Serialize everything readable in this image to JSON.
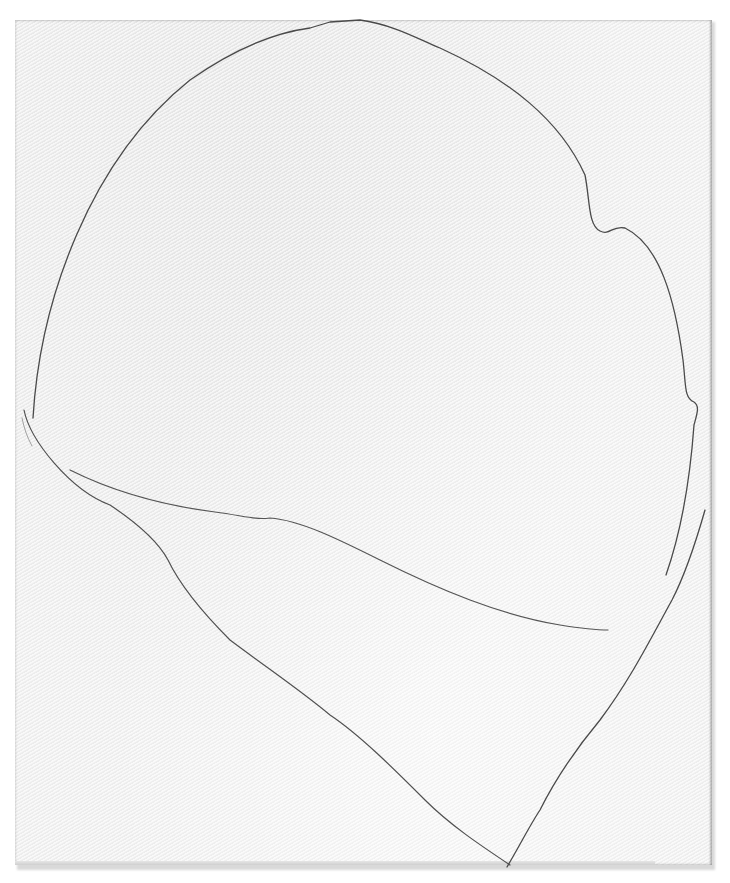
{
  "artwork": {
    "medium": "pencil line drawing on textured paper",
    "colors": {
      "background": "#ffffff",
      "paper": "#f2f2f2",
      "line": "#4a4a4a",
      "faint_line": "#8a8a8a"
    },
    "strokes": [
      {
        "name": "outer-contour",
        "path": "M 33 418 C 40 300 90 160 190 80 C 240 45 280 32 310 28 L 330 22 L 360 20 C 395 25 420 40 440 48 C 510 80 560 120 585 175 C 590 200 588 225 600 231 C 610 236 612 225 625 228 C 660 245 675 300 683 360 C 686 385 684 398 694 402 C 700 406 697 414 694 425 C 690 480 680 535 666 575"
      },
      {
        "name": "inner-curve",
        "path": "M 70 470 C 110 490 160 505 215 512 C 245 516 255 520 270 518 C 300 520 340 540 380 560 C 440 590 500 615 560 625 C 585 629 600 630 608 630"
      },
      {
        "name": "left-lower-contour",
        "path": "M 24 410 C 30 440 70 490 110 505 C 140 525 160 545 168 560 C 180 585 200 610 230 640 C 270 670 300 690 330 715 C 360 735 395 770 425 800 C 450 825 480 845 510 865"
      },
      {
        "name": "right-lower-stroke",
        "path": "M 507 867 C 520 845 530 825 540 810 C 555 780 575 750 600 720 C 630 680 650 640 672 600 C 685 575 695 545 705 510"
      },
      {
        "name": "faint-left-echo",
        "path": "M 22 418 C 24 428 27 437 32 446"
      }
    ]
  }
}
